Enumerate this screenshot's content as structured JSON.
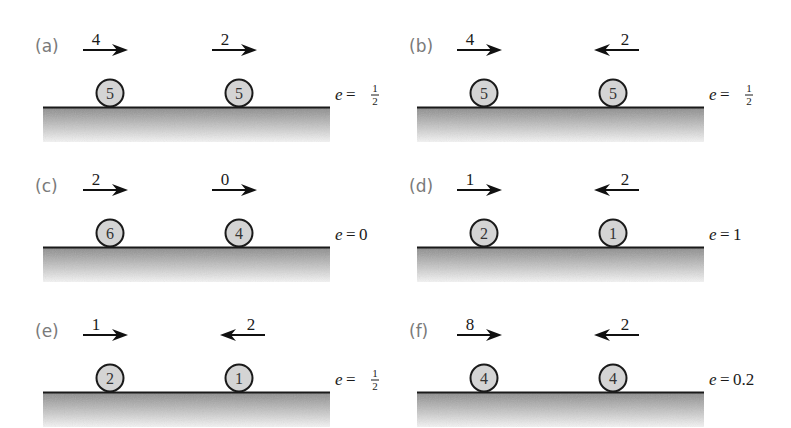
{
  "figure": {
    "panels": [
      {
        "label": "(a)",
        "restitution": {
          "symbol": "e",
          "value": "1/2",
          "fraction": true
        },
        "spheres": [
          {
            "mass": "5",
            "speed": "4",
            "direction": "right"
          },
          {
            "mass": "5",
            "speed": "2",
            "direction": "right"
          }
        ]
      },
      {
        "label": "(b)",
        "restitution": {
          "symbol": "e",
          "value": "1/2",
          "fraction": true
        },
        "spheres": [
          {
            "mass": "5",
            "speed": "4",
            "direction": "right"
          },
          {
            "mass": "5",
            "speed": "2",
            "direction": "left"
          }
        ]
      },
      {
        "label": "(c)",
        "restitution": {
          "symbol": "e",
          "value": "0",
          "fraction": false
        },
        "spheres": [
          {
            "mass": "6",
            "speed": "2",
            "direction": "right"
          },
          {
            "mass": "4",
            "speed": "0",
            "direction": "right"
          }
        ]
      },
      {
        "label": "(d)",
        "restitution": {
          "symbol": "e",
          "value": "1",
          "fraction": false
        },
        "spheres": [
          {
            "mass": "2",
            "speed": "1",
            "direction": "right"
          },
          {
            "mass": "1",
            "speed": "2",
            "direction": "left"
          }
        ]
      },
      {
        "label": "(e)",
        "restitution": {
          "symbol": "e",
          "value": "1/2",
          "fraction": true
        },
        "spheres": [
          {
            "mass": "2",
            "speed": "1",
            "direction": "right"
          },
          {
            "mass": "1",
            "speed": "2",
            "direction": "left"
          }
        ]
      },
      {
        "label": "(f)",
        "restitution": {
          "symbol": "e",
          "value": "0.2",
          "fraction": false
        },
        "spheres": [
          {
            "mass": "4",
            "speed": "8",
            "direction": "right"
          },
          {
            "mass": "4",
            "speed": "2",
            "direction": "left"
          }
        ]
      }
    ],
    "colors": {
      "sphere_fill": "#d4d4d4",
      "sphere_stroke": "#1a1a1a",
      "ground_top": "#8a8a8a",
      "ground_bottom": "#f4f4f4",
      "label": "#7a7a7a"
    }
  }
}
